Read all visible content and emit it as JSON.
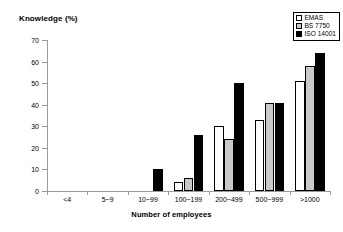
{
  "chart_data": {
    "type": "bar",
    "title": "Knowledge (%)",
    "xlabel": "Number of employees",
    "ylabel": "",
    "ylim": [
      0,
      70
    ],
    "ytick_step": 10,
    "yticks": [
      0,
      10,
      20,
      30,
      40,
      50,
      60,
      70
    ],
    "grid": false,
    "legend_position": "top-right",
    "categories": [
      "<4",
      "5~9",
      "10~99",
      "100~199",
      "200~499",
      "500~999",
      ">1000"
    ],
    "series": [
      {
        "name": "EMAS",
        "color": "#ffffff",
        "values": [
          0,
          0,
          0,
          4,
          30,
          33,
          51
        ]
      },
      {
        "name": "BS 7750",
        "color": "#c9c9c9",
        "values": [
          0,
          0,
          0,
          6,
          24,
          41,
          58
        ]
      },
      {
        "name": "ISO 14001",
        "color": "#000000",
        "values": [
          0,
          0,
          10,
          26,
          50,
          41,
          64
        ]
      }
    ]
  },
  "legend": {
    "items": [
      {
        "label": "EMAS"
      },
      {
        "label": "BS 7750"
      },
      {
        "label": "ISO 14001"
      }
    ]
  }
}
